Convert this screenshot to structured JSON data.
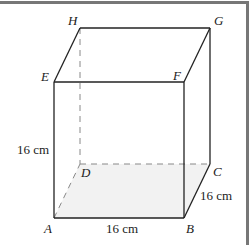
{
  "figure": {
    "type": "cube",
    "colors": {
      "frame": "#777777",
      "edge": "#222222",
      "hidden_edge": "#888888",
      "shaded_face": "#f2f2f2",
      "background": "#ffffff"
    },
    "vertices": {
      "A": {
        "label": "A",
        "x": 54,
        "y": 218
      },
      "B": {
        "label": "B",
        "x": 184,
        "y": 218
      },
      "C": {
        "label": "C",
        "x": 210,
        "y": 164
      },
      "D": {
        "label": "D",
        "x": 80,
        "y": 164
      },
      "E": {
        "label": "E",
        "x": 54,
        "y": 82
      },
      "F": {
        "label": "F",
        "x": 184,
        "y": 82
      },
      "G": {
        "label": "G",
        "x": 210,
        "y": 28
      },
      "H": {
        "label": "H",
        "x": 80,
        "y": 28
      }
    },
    "dimensions": {
      "height": "16 cm",
      "width": "16 cm",
      "depth": "16 cm"
    }
  }
}
